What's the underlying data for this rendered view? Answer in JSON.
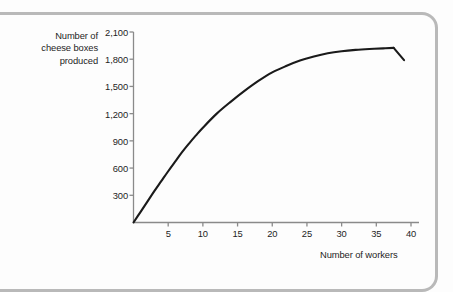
{
  "figure": {
    "frame_color": "#b9b9b9",
    "background": "#fdfdfd"
  },
  "chart_data": {
    "type": "line",
    "title": "",
    "xlabel": "Number of workers",
    "ylabel": "Number of cheese boxes produced",
    "ylabel_lines": "Number of\ncheese boxes\nproduced",
    "grid": false,
    "legend": null,
    "line_color": "#1a1a1a",
    "axis_color": "#8a8a8a",
    "xlim": [
      0,
      41
    ],
    "ylim": [
      0,
      2100
    ],
    "xticks": [
      5,
      10,
      15,
      20,
      25,
      30,
      35,
      40
    ],
    "xtick_labels": [
      "5",
      "10",
      "15",
      "20",
      "25",
      "30",
      "35",
      "40"
    ],
    "yticks": [
      300,
      600,
      900,
      1200,
      1500,
      1800,
      2100
    ],
    "ytick_labels": [
      "300",
      "600",
      "900",
      "1,200",
      "1,500",
      "1,800",
      "2,100"
    ],
    "series": [
      {
        "name": "cheese boxes produced",
        "x": [
          0,
          1,
          2,
          3,
          4,
          5,
          6,
          7,
          8,
          9,
          10,
          12,
          14,
          16,
          18,
          20,
          22,
          24,
          26,
          28,
          30,
          32,
          34,
          36,
          37.5,
          39
        ],
        "y": [
          0,
          115,
          230,
          345,
          455,
          565,
          670,
          775,
          870,
          960,
          1045,
          1200,
          1330,
          1450,
          1560,
          1655,
          1725,
          1785,
          1830,
          1865,
          1888,
          1903,
          1913,
          1920,
          1925,
          1790
        ]
      }
    ],
    "annotations": {
      "peak_workers": 37.5,
      "peak_output": 1925,
      "final_workers": 39,
      "final_output": 1790
    }
  }
}
